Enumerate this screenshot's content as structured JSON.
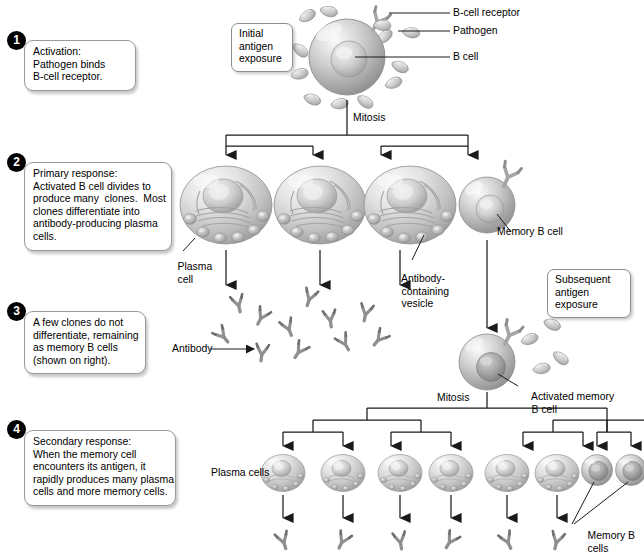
{
  "diagram": {
    "colors": {
      "badge_bg": "#000000",
      "badge_text": "#ffffff",
      "cell_light": "#f2f2f2",
      "cell_mid": "#b9b9b9",
      "cell_dark": "#8a8a8a",
      "nucleus": "#d8d8d8",
      "line": "#1a1a1a",
      "box_border": "#9a9a9a"
    }
  },
  "steps": [
    {
      "number": "1",
      "lines": [
        "Activation:",
        "Pathogen binds",
        "B-cell receptor."
      ]
    },
    {
      "number": "2",
      "lines": [
        "Primary response:",
        "Activated B cell divides to",
        "produce many  clones.  Most",
        "clones differentiate into",
        "antibody-producing plasma",
        "cells."
      ]
    },
    {
      "number": "3",
      "lines": [
        "A few clones do not",
        "differentiate, remaining",
        "as memory B cells",
        "(shown on right)."
      ]
    },
    {
      "number": "4",
      "lines": [
        "Secondary response:",
        "When the memory cell",
        "encounters its antigen, it",
        "rapidly produces many plasma",
        "cells and more memory cells."
      ]
    }
  ],
  "boxes": {
    "initial_exposure": [
      "Initial",
      "antigen",
      "exposure"
    ],
    "subsequent_exposure": [
      "Subsequent",
      "antigen",
      "exposure"
    ]
  },
  "labels": {
    "b_cell_receptor": "B-cell receptor",
    "pathogen": "Pathogen",
    "b_cell": "B cell",
    "mitosis_top": "Mitosis",
    "mitosis_bottom": "Mitosis",
    "plasma_cell": [
      "Plasma",
      "cell"
    ],
    "memory_b_cell": "Memory B cell",
    "antibody_vesicle": [
      "Antibody-",
      "containing",
      "vesicle"
    ],
    "antibody": "Antibody",
    "activated_memory": [
      "Activated memory",
      "B cell"
    ],
    "plasma_cells": "Plasma cells",
    "memory_b_cells": [
      "Memory B",
      "cells"
    ]
  },
  "counts": {
    "primary_plasma_cells": 3,
    "primary_memory_cells": 1,
    "secondary_plasma_cells": 6,
    "secondary_memory_cells": 2,
    "free_antibodies_primary": 11,
    "free_antibodies_secondary": 6,
    "pathogens_top": 12,
    "pathogens_secondary": 4
  }
}
